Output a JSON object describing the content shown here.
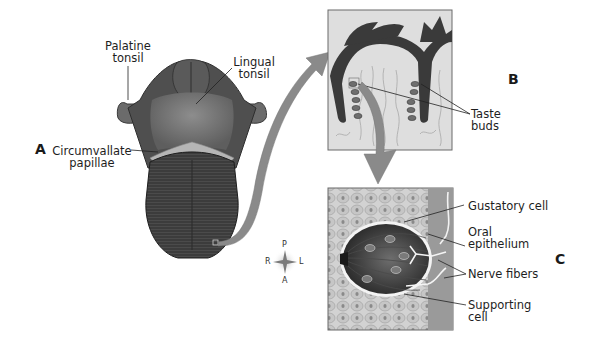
{
  "figure": {
    "panels": [
      {
        "id": "A",
        "letter": "A",
        "description": "Dorsal surface of the tongue"
      },
      {
        "id": "B",
        "letter": "B",
        "description": "Section through papillae showing taste buds"
      },
      {
        "id": "C",
        "letter": "C",
        "description": "Enlarged taste bud"
      }
    ],
    "panel_a_labels": {
      "palatine_1": "Palatine",
      "palatine_2": "tonsil",
      "lingual_1": "Lingual",
      "lingual_2": "tonsil",
      "circ_1": "Circumvallate",
      "circ_2": "papillae"
    },
    "panel_b_labels": {
      "taste_1": "Taste",
      "taste_2": "buds"
    },
    "panel_c_labels": {
      "gustatory": "Gustatory cell",
      "oral_1": "Oral",
      "oral_2": "epithelium",
      "nerve": "Nerve fibers",
      "supporting_1": "Supporting",
      "supporting_2": "cell"
    },
    "compass": {
      "top": "P",
      "bottom": "A",
      "left": "R",
      "right": "L"
    }
  },
  "colors": {
    "tongue_dark": "#3a3a3a",
    "tongue_mid": "#5a5a5a",
    "papillae": "#b5b5b5",
    "arrow": "#8a8a8a",
    "panel_bg": "#dcdcdc",
    "label_text": "#1e1e1e"
  }
}
